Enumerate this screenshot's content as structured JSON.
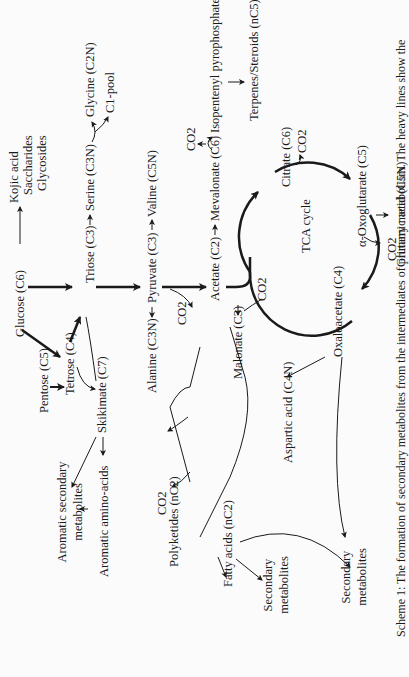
{
  "diagram": {
    "type": "metabolic-pathway-scheme",
    "orientation": "rotated-90-ccw",
    "nodes": {
      "glucose": "Glucose (C6)",
      "kojic_acid": "Kojic acid",
      "saccharides": "Saccharides",
      "glycosides": "Glycosides",
      "pentose": "Pentose (C5)",
      "tetrose": "Tetrose (C4)",
      "triose": "Triose (C3)",
      "serine": "Serine (C3N)",
      "glycine": "Glycine (C2N)",
      "c1_pool": "C1-pool",
      "skikimate": "Skikimate (C7)",
      "aromatic_secondary": [
        "Aromatic secondary",
        "metabolites"
      ],
      "aromatic_amino_acids": "Aromatic amino-acids",
      "alanine": "Alanine (C3N)",
      "pyruvate": "Pyruvate (C3)",
      "valine": "Valine (C5N)",
      "co2_pyruvate": "CO2",
      "acetate": "Acetate (C2)",
      "mevalonate": "Mevalonate (C6)",
      "co2_mevalonate": "CO2",
      "isopentenyl": "Isopentenyl pyrophosphate (C5)",
      "terpenes": "Terpenes/Steroids (nC5)",
      "malonate": "Malonate (C3)",
      "co2_malonate": "CO2",
      "co2_polyketide": "CO2",
      "polyketides": "Polyketides (nC2)",
      "fatty_acids": "Fatty acids (nC2)",
      "secondary_fatty": [
        "Secondary",
        "metabolites"
      ],
      "secondary_oxalo": [
        "Secondary",
        "metabolites"
      ],
      "tca_cycle": "TCA cycle",
      "citrate": "Citrate (C6)",
      "co2_citrate": "CO2",
      "oxoglutarate": "α-Oxoglutarate (C5)",
      "glutamic_acid": "Glutamic acid (C5N)",
      "oxaloacetate": "Oxaloacetate (C4)",
      "co2_oxalo": "CO2",
      "aspartic_acid": "Aspartic acid (C4N)"
    },
    "caption": "Scheme 1: The formation of secondary metabolites from the intermediates of primary metabolism. The heavy lines show the"
  }
}
